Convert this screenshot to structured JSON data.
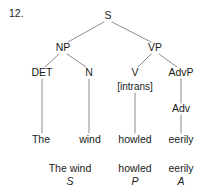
{
  "figure": {
    "item_number": "12.",
    "line_color": "#8c8c8c",
    "text_color": "#1b1b1b",
    "background": "#ffffff"
  },
  "tree": {
    "nodes": [
      {
        "id": "S",
        "label": "S",
        "x": 108,
        "y": 16
      },
      {
        "id": "NP",
        "label": "NP",
        "x": 63,
        "y": 48
      },
      {
        "id": "VP",
        "label": "VP",
        "x": 155,
        "y": 48
      },
      {
        "id": "DET",
        "label": "DET",
        "x": 42,
        "y": 73
      },
      {
        "id": "N",
        "label": "N",
        "x": 89,
        "y": 73
      },
      {
        "id": "V",
        "label": "V",
        "x": 135,
        "y": 73
      },
      {
        "id": "AdvP",
        "label": "AdvP",
        "x": 181,
        "y": 73
      },
      {
        "id": "intrans",
        "label": "[intrans]",
        "x": 135,
        "y": 87
      },
      {
        "id": "Adv",
        "label": "Adv",
        "x": 181,
        "y": 109
      }
    ],
    "leaves": [
      {
        "id": "the",
        "label": "The",
        "x": 41,
        "y": 140
      },
      {
        "id": "wind",
        "label": "wind",
        "x": 90,
        "y": 140
      },
      {
        "id": "howled",
        "label": "howled",
        "x": 135,
        "y": 140
      },
      {
        "id": "eerily",
        "label": "eerily",
        "x": 181,
        "y": 140
      }
    ],
    "functions": [
      {
        "id": "subject",
        "phrase": "The wind",
        "function": "S",
        "x": 70,
        "phrase_y": 169,
        "function_y": 182
      },
      {
        "id": "predicate",
        "phrase": "howled",
        "function": "P",
        "x": 135,
        "phrase_y": 169,
        "function_y": 182
      },
      {
        "id": "adverbial",
        "phrase": "eerily",
        "function": "A",
        "x": 181,
        "phrase_y": 169,
        "function_y": 182
      }
    ],
    "edges": [
      {
        "id": "s-np",
        "x1": 104,
        "y1": 22,
        "x2": 68,
        "y2": 42
      },
      {
        "id": "s-vp",
        "x1": 112,
        "y1": 22,
        "x2": 151,
        "y2": 42
      },
      {
        "id": "np-det",
        "x1": 59,
        "y1": 54,
        "x2": 45,
        "y2": 67
      },
      {
        "id": "np-n",
        "x1": 67,
        "y1": 54,
        "x2": 86,
        "y2": 67
      },
      {
        "id": "vp-v",
        "x1": 151,
        "y1": 54,
        "x2": 138,
        "y2": 67
      },
      {
        "id": "vp-advp",
        "x1": 159,
        "y1": 54,
        "x2": 177,
        "y2": 67
      },
      {
        "id": "det-the",
        "x1": 42,
        "y1": 79,
        "x2": 42,
        "y2": 133
      },
      {
        "id": "n-wind",
        "x1": 89,
        "y1": 79,
        "x2": 89,
        "y2": 133
      },
      {
        "id": "v-howled",
        "x1": 135,
        "y1": 93,
        "x2": 135,
        "y2": 133
      },
      {
        "id": "advp-adv",
        "x1": 181,
        "y1": 79,
        "x2": 181,
        "y2": 103
      },
      {
        "id": "adv-eerily",
        "x1": 181,
        "y1": 115,
        "x2": 181,
        "y2": 133
      }
    ]
  }
}
